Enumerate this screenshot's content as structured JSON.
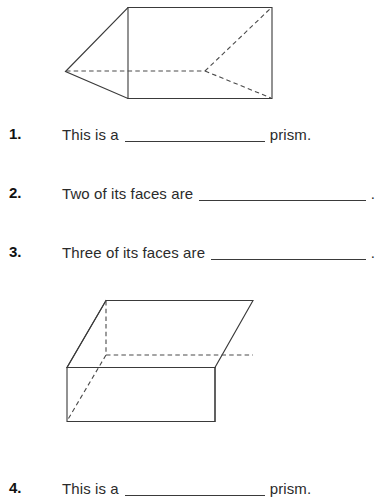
{
  "worksheet": {
    "figures": [
      {
        "name": "triangular-prism",
        "shape_type": "triangular prism",
        "description": "Triangular prism drawn in oblique projection with hidden edges shown as dashed lines"
      },
      {
        "name": "rectangular-prism",
        "shape_type": "rectangular prism",
        "description": "Flat rectangular prism (cuboid) drawn in oblique projection with hidden edges shown as dashed lines"
      }
    ],
    "questions": [
      {
        "number": "1.",
        "text": "This is a",
        "blank": "",
        "tail": "prism",
        "period": "."
      },
      {
        "number": "2.",
        "text": "Two of its faces are",
        "blank": "",
        "tail": "",
        "period": "."
      },
      {
        "number": "3.",
        "text": "Three of its faces are",
        "blank": "",
        "tail": "",
        "period": "."
      },
      {
        "number": "4.",
        "text": "This is a",
        "blank": "",
        "tail": "prism",
        "period": "."
      }
    ]
  }
}
